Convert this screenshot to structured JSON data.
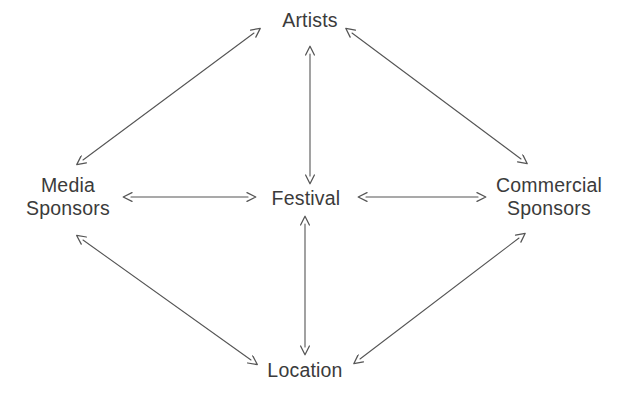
{
  "diagram": {
    "background_color": "#ffffff",
    "line_color": "#555555",
    "text_color": "#3b3b3b",
    "nodes": [
      {
        "id": "artists",
        "label": "Artists",
        "lines": [
          "Artists"
        ],
        "x": 310,
        "y": 20
      },
      {
        "id": "media-sponsors",
        "label": "Media Sponsors",
        "lines": [
          "Media",
          "Sponsors"
        ],
        "x": 68,
        "y": 197
      },
      {
        "id": "festival",
        "label": "Festival",
        "lines": [
          "Festival"
        ],
        "x": 306,
        "y": 198
      },
      {
        "id": "commercial-sponsors",
        "label": "Commercial Sponsors",
        "lines": [
          "Commercial",
          "Sponsors"
        ],
        "x": 549,
        "y": 197
      },
      {
        "id": "location",
        "label": "Location",
        "lines": [
          "Location"
        ],
        "x": 305,
        "y": 370
      }
    ],
    "edges": [
      {
        "id": "festival-artists",
        "from": "Festival",
        "to": "Artists",
        "arrow": "double",
        "x1": 310,
        "y1": 176,
        "x2": 310,
        "y2": 54
      },
      {
        "id": "festival-location",
        "from": "Festival",
        "to": "Location",
        "arrow": "double",
        "x1": 305,
        "y1": 224,
        "x2": 305,
        "y2": 347
      },
      {
        "id": "festival-media-sponsors",
        "from": "Festival",
        "to": "Media Sponsors",
        "arrow": "double",
        "x1": 248,
        "y1": 197,
        "x2": 131,
        "y2": 197
      },
      {
        "id": "festival-commercial-sponsors",
        "from": "Festival",
        "to": "Commercial Sponsors",
        "arrow": "double",
        "x1": 366,
        "y1": 197,
        "x2": 478,
        "y2": 197
      },
      {
        "id": "media-sponsors-artists",
        "from": "Media Sponsors",
        "to": "Artists",
        "arrow": "double",
        "x1": 83,
        "y1": 160,
        "x2": 254,
        "y2": 33
      },
      {
        "id": "artists-commercial-sponsors",
        "from": "Artists",
        "to": "Commercial Sponsors",
        "arrow": "double",
        "x1": 352,
        "y1": 33,
        "x2": 521,
        "y2": 159
      },
      {
        "id": "media-sponsors-location",
        "from": "Media Sponsors",
        "to": "Location",
        "arrow": "double",
        "x1": 83,
        "y1": 240,
        "x2": 251,
        "y2": 360
      },
      {
        "id": "location-commercial-sponsors",
        "from": "Location",
        "to": "Commercial Sponsors",
        "arrow": "double",
        "x1": 360,
        "y1": 359,
        "x2": 519,
        "y2": 238
      }
    ]
  }
}
